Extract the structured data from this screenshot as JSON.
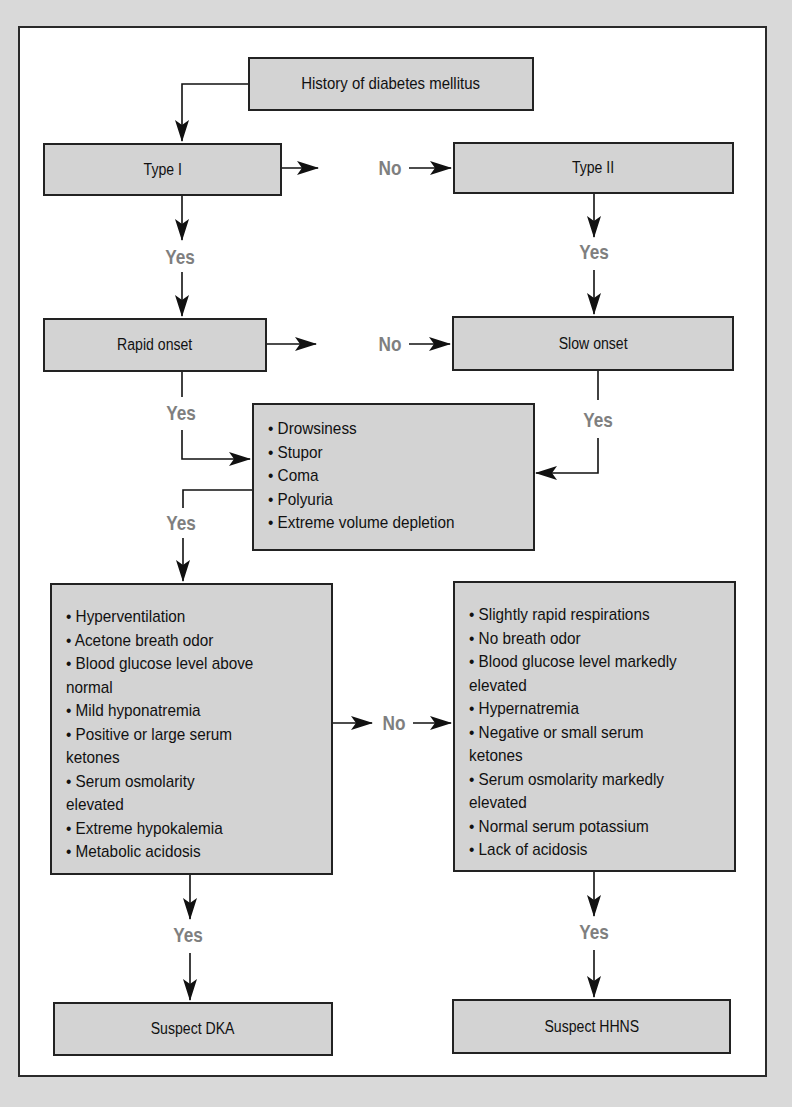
{
  "header": {
    "caption_fragment": ""
  },
  "diagram": {
    "start": {
      "label": "History of diabetes mellitus"
    },
    "type1": {
      "label": "Type I"
    },
    "type2": {
      "label": "Type II"
    },
    "rapid_onset": {
      "label": "Rapid onset"
    },
    "slow_onset": {
      "label": "Slow onset"
    },
    "symptoms": {
      "items": [
        "• Drowsiness",
        "• Stupor",
        "• Coma",
        "• Polyuria",
        "• Extreme volume depletion"
      ]
    },
    "dka_criteria": {
      "items": [
        "• Hyperventilation",
        "• Acetone breath odor",
        "• Blood glucose level above",
        "normal",
        "• Mild hyponatremia",
        "• Positive or large serum",
        "ketones",
        "• Serum osmolarity",
        "elevated",
        "• Extreme hypokalemia",
        "• Metabolic acidosis"
      ]
    },
    "hhns_criteria": {
      "items": [
        "• Slightly rapid respirations",
        "• No breath odor",
        "• Blood glucose level markedly",
        "elevated",
        "• Hypernatremia",
        "• Negative or small serum",
        "ketones",
        "• Serum osmolarity markedly",
        "elevated",
        "• Normal serum potassium",
        "• Lack of acidosis"
      ]
    },
    "suspect_dka": {
      "label": "Suspect DKA"
    },
    "suspect_hhns": {
      "label": "Suspect HHNS"
    },
    "edge_labels": {
      "type1_no": "No",
      "type1_yes": "Yes",
      "type2_yes": "Yes",
      "rapid_no": "No",
      "rapid_yes": "Yes",
      "slow_yes": "Yes",
      "symptoms_yes": "Yes",
      "dka_no": "No",
      "dka_yes": "Yes",
      "hhns_yes": "Yes"
    },
    "colors": {
      "box_fill": "#d3d3d3",
      "label_gray": "#7f7f7f",
      "line": "#111111",
      "page_bg": "#d9d9d9"
    }
  }
}
